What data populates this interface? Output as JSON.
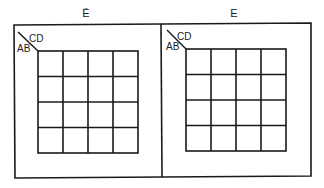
{
  "diagram": {
    "type": "karnaugh-map-pair",
    "variables": [
      "A",
      "B",
      "C",
      "D",
      "E"
    ],
    "maps": [
      {
        "title": "Ē",
        "title_meaning": "E complement (E = 0)",
        "row_variables": "AB",
        "column_variables": "CD",
        "rows": 4,
        "cols": 4,
        "cells": [
          [
            "",
            "",
            "",
            ""
          ],
          [
            "",
            "",
            "",
            ""
          ],
          [
            "",
            "",
            "",
            ""
          ],
          [
            "",
            "",
            "",
            ""
          ]
        ]
      },
      {
        "title": "E",
        "title_meaning": "E = 1",
        "row_variables": "AB",
        "column_variables": "CD",
        "rows": 4,
        "cols": 4,
        "cells": [
          [
            "",
            "",
            "",
            ""
          ],
          [
            "",
            "",
            "",
            ""
          ],
          [
            "",
            "",
            "",
            ""
          ],
          [
            "",
            "",
            "",
            ""
          ]
        ]
      }
    ],
    "colors": {
      "line": "#1a1a1a",
      "background": "#ffffff"
    }
  }
}
